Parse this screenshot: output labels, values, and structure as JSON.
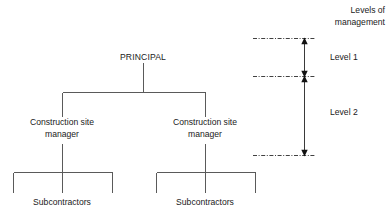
{
  "diagram": {
    "type": "organisational-hierarchy-chart",
    "title": "",
    "nodes": {
      "root": {
        "label": "PRINCIPAL"
      },
      "manager_left": {
        "label_line1": "Construction site",
        "label_line2": "manager"
      },
      "manager_right": {
        "label_line1": "Construction site",
        "label_line2": "manager"
      },
      "subcontractors_left": {
        "label": "Subcontractors"
      },
      "subcontractors_right": {
        "label": "Subcontractors"
      }
    },
    "line_color": "#5a5a5a",
    "text_color": "#1a1a1a"
  },
  "legend": {
    "title_line1": "Levels of",
    "title_line2": "management",
    "levels": [
      {
        "label": "Level 1"
      },
      {
        "label": "Level 2"
      }
    ],
    "divider_color": "#2b2b2b",
    "arrow_color": "#111111"
  }
}
